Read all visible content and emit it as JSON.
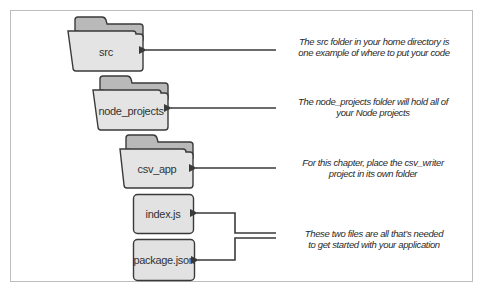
{
  "diagram": {
    "type": "folder-structure",
    "colors": {
      "folder_back": "#b9b9b9",
      "folder_front": "#e4e4e4",
      "file_fill": "#e2e2e2",
      "stroke": "#3a3a3a",
      "frame": "#bdbdbd"
    },
    "nodes": [
      {
        "id": "src",
        "kind": "folder",
        "label": "src"
      },
      {
        "id": "node_projects",
        "kind": "folder",
        "label": "node_projects"
      },
      {
        "id": "csv_app",
        "kind": "folder",
        "label": "csv_app"
      },
      {
        "id": "index_js",
        "kind": "file",
        "label": "index.js"
      },
      {
        "id": "package_json",
        "kind": "file",
        "label": "package.json"
      }
    ],
    "annotations": [
      {
        "target": "src",
        "lines": [
          "The src folder in your home directory is",
          "one example of where to put your code"
        ]
      },
      {
        "target": "node_projects",
        "lines": [
          "The node_projects folder will hold all of",
          "your Node projects"
        ]
      },
      {
        "target": "csv_app",
        "lines": [
          "For this chapter, place the csv_writer",
          "project in its own folder"
        ]
      },
      {
        "target": "index_js,package_json",
        "lines": [
          "These two files are all that’s needed",
          "to get started with your application"
        ]
      }
    ]
  }
}
